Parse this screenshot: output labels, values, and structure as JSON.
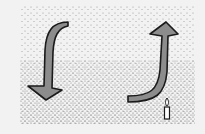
{
  "diagram": {
    "elements": [
      {
        "id": "left-arrow",
        "direction": "down",
        "label": ""
      },
      {
        "id": "right-arrow",
        "direction": "up",
        "label": ""
      },
      {
        "id": "candle",
        "label": ""
      }
    ],
    "colors": {
      "background": "#f2f2f2",
      "arrow_fill": "#8c8c8c",
      "outline": "#1a1a1a",
      "stipple": "#444444"
    }
  }
}
